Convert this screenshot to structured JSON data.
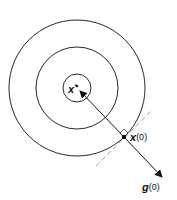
{
  "diagram": {
    "labels": {
      "optimum": "x",
      "optimum_sup": "*",
      "point": "x",
      "point_sup": "(0)",
      "gradient": "g",
      "gradient_sup": "(0)"
    },
    "center": [
      77,
      88
    ],
    "contour_radii": [
      14,
      41,
      68
    ],
    "point_x0": [
      124,
      137
    ],
    "arrow_tip": [
      162,
      177
    ],
    "colors": {
      "line": "#111111",
      "tangent": "#888888"
    }
  }
}
